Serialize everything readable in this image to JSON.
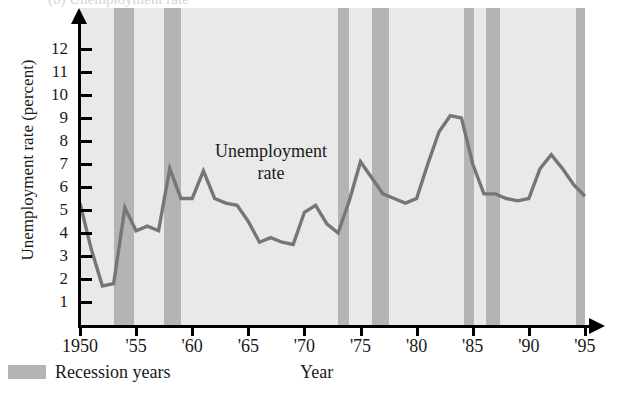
{
  "figure": {
    "cutoff_title": "(b) Unemployment rate",
    "annotation_line1": "Unemployment",
    "annotation_line2": "rate"
  },
  "legend": {
    "swatch_color": "#b4b4b4",
    "label": "Recession years"
  },
  "axes": {
    "ylabel": "Unemployment rate (percent)",
    "xlabel": "Year",
    "y_ticks": [
      12,
      11,
      10,
      9,
      8,
      7,
      6,
      5,
      4,
      3,
      2,
      1
    ],
    "x_ticks": [
      "1950",
      "'55",
      "'60",
      "'65",
      "'70",
      "'75",
      "'80",
      "'85",
      "'90",
      "'95"
    ],
    "x_tick_years": [
      1950,
      1955,
      1960,
      1965,
      1970,
      1975,
      1980,
      1985,
      1990,
      1995
    ]
  },
  "chart_data": {
    "type": "line",
    "title": "Unemployment rate",
    "xlabel": "Year",
    "ylabel": "Unemployment rate (percent)",
    "xlim": [
      1950,
      1995
    ],
    "ylim": [
      0,
      13
    ],
    "grid": false,
    "legend_position": "below-left",
    "line_color": "#767676",
    "plot_background": "#e9e9e9",
    "x": [
      1950,
      1951,
      1952,
      1953,
      1954,
      1955,
      1956,
      1957,
      1958,
      1959,
      1960,
      1961,
      1962,
      1963,
      1964,
      1965,
      1966,
      1967,
      1968,
      1969,
      1970,
      1971,
      1972,
      1973,
      1974,
      1975,
      1976,
      1977,
      1978,
      1979,
      1980,
      1981,
      1982,
      1983,
      1984,
      1985,
      1986,
      1987,
      1988,
      1989,
      1990,
      1991,
      1992,
      1993,
      1994,
      1995
    ],
    "values": [
      5.3,
      3.3,
      1.7,
      1.8,
      5.1,
      4.1,
      4.3,
      4.1,
      6.8,
      5.5,
      5.5,
      6.7,
      5.5,
      5.3,
      5.2,
      4.5,
      3.6,
      3.8,
      3.6,
      3.5,
      4.9,
      5.2,
      4.4,
      4.0,
      5.4,
      7.1,
      6.4,
      5.7,
      5.5,
      5.3,
      5.5,
      7.0,
      8.4,
      9.1,
      9.0,
      7.0,
      5.7,
      5.7,
      5.5,
      5.4,
      5.5,
      6.8,
      7.4,
      6.8,
      6.1,
      5.6
    ],
    "series": [
      {
        "name": "Unemployment rate",
        "values": [
          5.3,
          3.3,
          1.7,
          1.8,
          5.1,
          4.1,
          4.3,
          4.1,
          6.8,
          5.5,
          5.5,
          6.7,
          5.5,
          5.3,
          5.2,
          4.5,
          3.6,
          3.8,
          3.6,
          3.5,
          4.9,
          5.2,
          4.4,
          4.0,
          5.4,
          7.1,
          6.4,
          5.7,
          5.5,
          5.3,
          5.5,
          7.0,
          8.4,
          9.1,
          9.0,
          7.0,
          5.7,
          5.7,
          5.5,
          5.4,
          5.5,
          6.8,
          7.4,
          6.8,
          6.1,
          5.6
        ]
      }
    ],
    "recession_bands": [
      {
        "start": 1953.0,
        "end": 1954.8
      },
      {
        "start": 1957.5,
        "end": 1959.0
      },
      {
        "start": 1973.0,
        "end": 1974.0
      },
      {
        "start": 1976.0,
        "end": 1977.5
      },
      {
        "start": 1984.2,
        "end": 1985.1
      },
      {
        "start": 1986.2,
        "end": 1987.4
      },
      {
        "start": 1994.2,
        "end": 1995.2
      }
    ],
    "annotations": [
      {
        "text": "Unemployment rate",
        "x": 1964,
        "y": 7.3
      }
    ]
  }
}
